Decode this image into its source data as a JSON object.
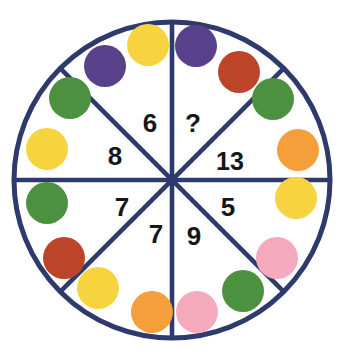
{
  "figure": {
    "type": "circular-sector-puzzle",
    "background_color": "#ffffff",
    "outline_color": "#2e3a6b",
    "outline_width": 5,
    "spoke_width": 4.6,
    "number_color": "#15151a"
  },
  "wheel": {
    "center_x": 172,
    "center_y": 180,
    "radius": 158,
    "sector_count": 8
  },
  "palette": {
    "purple": "#59408a",
    "yellow": "#f7d340",
    "green": "#4c9140",
    "red": "#bc4428",
    "orange": "#f59e3c",
    "pink": "#f4a9bc",
    "navy": "#2e3a6b",
    "white": "#ffffff",
    "black": "#15151a"
  },
  "sectors": [
    {
      "id": "sector-top-left",
      "label": "6",
      "x": 150,
      "y": 122,
      "angle_start": -90,
      "angle_end": -45
    },
    {
      "id": "sector-top-right",
      "label": "?",
      "x": 193,
      "y": 122,
      "angle_start": -90,
      "angle_end": -45
    },
    {
      "id": "sector-left-upper",
      "label": "8",
      "x": 113,
      "y": 155,
      "angle_start": -135,
      "angle_end": -90
    },
    {
      "id": "sector-right-upper",
      "label": "13",
      "x": 228,
      "y": 160,
      "angle_start": -45,
      "angle_end": 0
    },
    {
      "id": "sector-left-lower",
      "label": "7",
      "x": 122,
      "y": 208,
      "angle_start": 90,
      "angle_end": 135
    },
    {
      "id": "sector-bottom-left",
      "label": "7",
      "x": 156,
      "y": 234,
      "angle_start": 45,
      "angle_end": 90
    },
    {
      "id": "sector-bottom-right",
      "label": "9",
      "x": 194,
      "y": 236,
      "angle_start": 45,
      "angle_end": 90
    },
    {
      "id": "sector-right-lower",
      "label": "5",
      "x": 228,
      "y": 208,
      "angle_start": 0,
      "angle_end": 45
    }
  ],
  "numbers_in_reading_order": [
    "6",
    "?",
    "8",
    "13",
    "7",
    "7",
    "9",
    "5"
  ],
  "missing_value_marker": "?",
  "dots": [
    {
      "id": "dot-top-left-purple",
      "color_name": "purple",
      "color": "#59408a",
      "cx": 105,
      "cy": 66,
      "r": 21
    },
    {
      "id": "dot-top-left-yellow",
      "color_name": "yellow",
      "color": "#f7d340",
      "cx": 148,
      "cy": 45,
      "r": 21
    },
    {
      "id": "dot-top-right-purple",
      "color_name": "purple",
      "color": "#59408a",
      "cx": 196,
      "cy": 46,
      "r": 21
    },
    {
      "id": "dot-top-right-red",
      "color_name": "red",
      "color": "#bc4428",
      "cx": 239,
      "cy": 72,
      "r": 21
    },
    {
      "id": "dot-upper-right-green",
      "color_name": "green",
      "color": "#4c9140",
      "cx": 273,
      "cy": 99,
      "r": 21
    },
    {
      "id": "dot-right-orange",
      "color_name": "orange",
      "color": "#f59e3c",
      "cx": 298,
      "cy": 150,
      "r": 21
    },
    {
      "id": "dot-right-yellow",
      "color_name": "yellow",
      "color": "#f7d340",
      "cx": 296,
      "cy": 198,
      "r": 21
    },
    {
      "id": "dot-lower-right-pink",
      "color_name": "pink",
      "color": "#f4a9bc",
      "cx": 277,
      "cy": 258,
      "r": 21
    },
    {
      "id": "dot-bottom-right-green",
      "color_name": "green",
      "color": "#4c9140",
      "cx": 243,
      "cy": 291,
      "r": 21
    },
    {
      "id": "dot-bottom-pink",
      "color_name": "pink",
      "color": "#f4a9bc",
      "cx": 197,
      "cy": 312,
      "r": 21
    },
    {
      "id": "dot-bottom-orange",
      "color_name": "orange",
      "color": "#f59e3c",
      "cx": 152,
      "cy": 312,
      "r": 21
    },
    {
      "id": "dot-bottom-left-yellow",
      "color_name": "yellow",
      "color": "#f7d340",
      "cx": 98,
      "cy": 288,
      "r": 21
    },
    {
      "id": "dot-lower-left-red",
      "color_name": "red",
      "color": "#bc4428",
      "cx": 64,
      "cy": 258,
      "r": 21
    },
    {
      "id": "dot-left-green-lower",
      "color_name": "green",
      "color": "#4c9140",
      "cx": 47,
      "cy": 203,
      "r": 21
    },
    {
      "id": "dot-left-yellow",
      "color_name": "yellow",
      "color": "#f7d340",
      "cx": 47,
      "cy": 149,
      "r": 21
    },
    {
      "id": "dot-left-green-upper",
      "color_name": "green",
      "color": "#4c9140",
      "cx": 70,
      "cy": 98,
      "r": 21
    }
  ],
  "spokes": [
    {
      "id": "spoke-vertical",
      "x1": 172,
      "y1": 22,
      "x2": 172,
      "y2": 338
    },
    {
      "id": "spoke-horizontal",
      "x1": 14,
      "y1": 180,
      "x2": 330,
      "y2": 180
    },
    {
      "id": "spoke-diagonal-nw-se",
      "x1": 60,
      "y1": 68,
      "x2": 284,
      "y2": 292
    },
    {
      "id": "spoke-diagonal-ne-sw",
      "x1": 284,
      "y1": 68,
      "x2": 60,
      "y2": 292
    }
  ]
}
